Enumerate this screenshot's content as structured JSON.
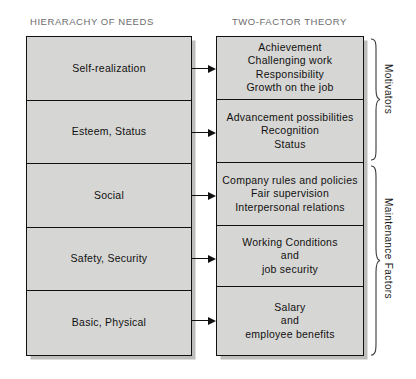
{
  "diagram": {
    "columns": {
      "left": {
        "title": "HIERARACHY OF NEEDS",
        "levels": [
          {
            "label": "Self-realization"
          },
          {
            "label": "Esteem, Status"
          },
          {
            "label": "Social"
          },
          {
            "label": "Safety, Security"
          },
          {
            "label": "Basic, Physical"
          }
        ]
      },
      "right": {
        "title": "TWO-FACTOR THEORY",
        "levels": [
          {
            "label": "Achievement\nChallenging work\nResponsibility\nGrowth on the job"
          },
          {
            "label": "Advancement possibilities\nRecognition\nStatus"
          },
          {
            "label": "Company rules and policies\nFair supervision\nInterpersonal relations"
          },
          {
            "label": "Working Conditions\nand\njob security"
          },
          {
            "label": "Salary\nand\nemployee benefits"
          }
        ]
      }
    },
    "groups": [
      {
        "label": "Motivators",
        "spans": [
          0,
          1
        ]
      },
      {
        "label": "Maintenance Factors",
        "spans": [
          2,
          3,
          4
        ]
      }
    ],
    "arrows": [
      {
        "from": "Self-realization",
        "to": "Achievement"
      },
      {
        "from": "Esteem, Status",
        "to": "Advancement possibilities"
      },
      {
        "from": "Social",
        "to": "Company rules and policies"
      },
      {
        "from": "Safety, Security",
        "to": "Working Conditions"
      },
      {
        "from": "Basic, Physical",
        "to": "Salary"
      }
    ],
    "colors": {
      "box_fill": "#d6d6d4",
      "box_border": "#111111",
      "box_shadow": "#bdbdbb",
      "title_text": "#6d6d6d",
      "body_text": "#111111",
      "background": "#ffffff"
    }
  }
}
